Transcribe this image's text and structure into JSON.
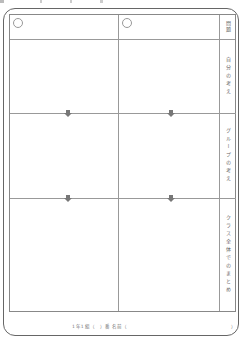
{
  "worksheet": {
    "header_row": {
      "left_cell": "",
      "middle_cell": ""
    },
    "labels": {
      "header": "問題",
      "row1": "自分の考え",
      "row2": "グループの考え",
      "row3": "クラス全体でのまとめ"
    },
    "footer": {
      "name_line": "1年1組（　）番 名前（",
      "close_paren": "）"
    },
    "colors": {
      "line": "#999999",
      "border": "#666666",
      "arrow": "#777777"
    }
  }
}
